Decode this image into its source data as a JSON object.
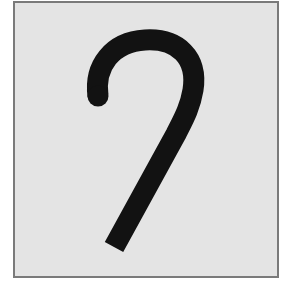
{
  "figure": {
    "colors": {
      "background": "#e4e4e4",
      "border": "#7a7a7a",
      "stroke": "#121212",
      "page": "#ffffff"
    },
    "stroke_width": 21,
    "path": "M 98 96 C 94 66, 112 42, 145 40 C 178 38, 198 58, 193 90 C 190 108, 183 120, 176 134 L 114 247"
  }
}
